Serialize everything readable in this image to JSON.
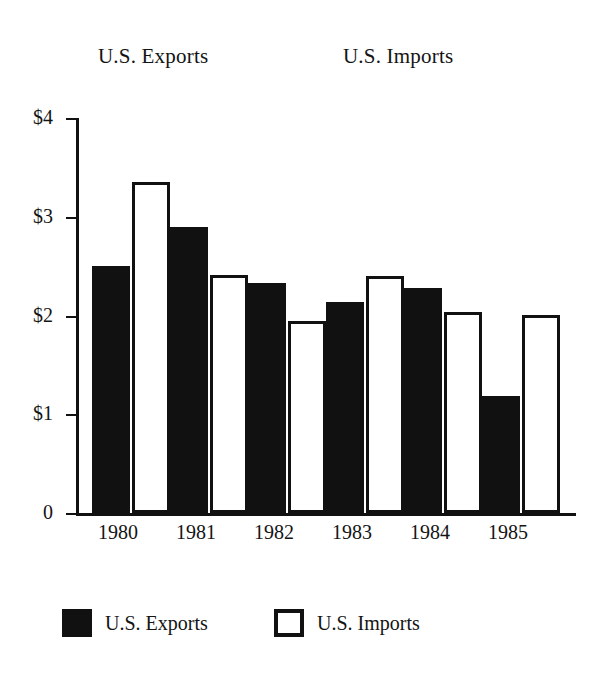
{
  "chart_data": {
    "type": "bar",
    "title": "",
    "titles_above_plot": [
      "U.S. Exports",
      "U.S. Imports"
    ],
    "categories": [
      "1980",
      "1981",
      "1982",
      "1983",
      "1984",
      "1985"
    ],
    "series": [
      {
        "name": "U.S. Exports",
        "color": "#111111",
        "style": "filled",
        "values": [
          2.5,
          2.9,
          2.33,
          2.14,
          2.28,
          1.19
        ]
      },
      {
        "name": "U.S. Imports",
        "color": "#ffffff",
        "style": "outlined",
        "values": [
          3.35,
          2.41,
          1.94,
          2.4,
          2.04,
          2.01
        ]
      }
    ],
    "xlabel": "",
    "ylabel": "",
    "ylim": [
      0,
      4
    ],
    "ytick_values": [
      4,
      3,
      2,
      1,
      0
    ],
    "ytick_labels": [
      "$4",
      "$3",
      "$2",
      "$1",
      "0"
    ],
    "grid": false,
    "legend_position": "bottom"
  },
  "titles": {
    "exports": "U.S. Exports",
    "imports": "U.S. Imports"
  },
  "legend": {
    "items": [
      {
        "label": "U.S. Exports",
        "swatch": "filled-square-icon"
      },
      {
        "label": "U.S. Imports",
        "swatch": "hollow-square-icon"
      }
    ]
  }
}
